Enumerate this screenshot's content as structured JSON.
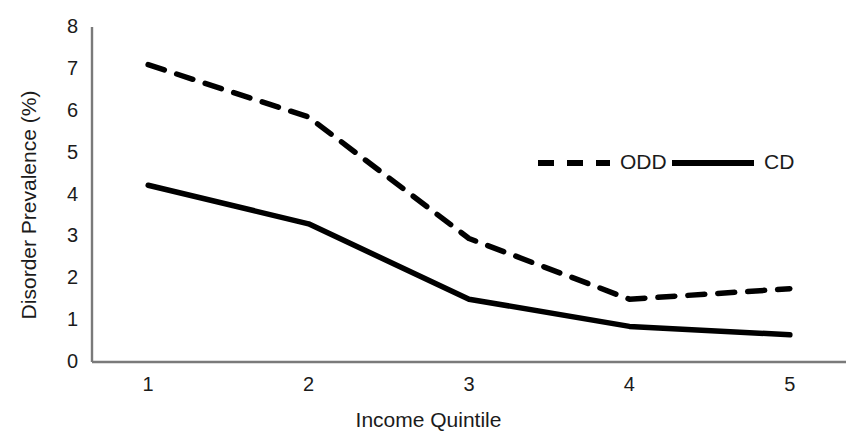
{
  "chart_data": {
    "type": "line",
    "title": "",
    "xlabel": "Income Quintile",
    "ylabel": "Disorder Prevalence (%)",
    "categories": [
      "1",
      "2",
      "3",
      "4",
      "5"
    ],
    "x": [
      1,
      2,
      3,
      4,
      5
    ],
    "xlim": [
      0.65,
      5.35
    ],
    "ylim": [
      0,
      8
    ],
    "yticks": [
      "0",
      "1",
      "2",
      "3",
      "4",
      "5",
      "6",
      "7",
      "8"
    ],
    "ytick_values": [
      0,
      1,
      2,
      3,
      4,
      5,
      6,
      7,
      8
    ],
    "xticks": [
      "1",
      "2",
      "3",
      "4",
      "5"
    ],
    "grid": false,
    "legend_position": "upper right",
    "series": [
      {
        "name": "ODD",
        "style": "dashed",
        "color": "#000000",
        "values": [
          7.1,
          5.85,
          2.95,
          1.5,
          1.75
        ]
      },
      {
        "name": "CD",
        "style": "solid",
        "color": "#000000",
        "values": [
          4.22,
          3.3,
          1.5,
          0.85,
          0.65
        ]
      }
    ]
  },
  "legend": {
    "items": [
      {
        "label": "ODD",
        "style": "dashed"
      },
      {
        "label": "CD",
        "style": "solid"
      }
    ]
  },
  "axes": {
    "line_color": "#7a7a7a"
  }
}
